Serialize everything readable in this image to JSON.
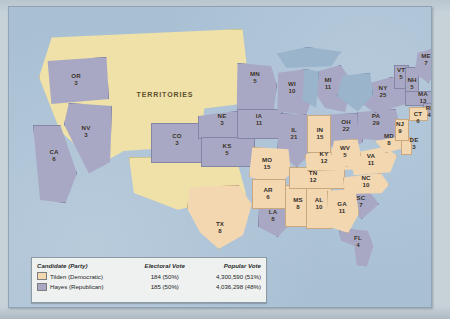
{
  "map": {
    "title": "1876 United States Presidential Election electoral map",
    "territories_label": "TERRITORIES",
    "colors": {
      "democratic": "#f2d7b0",
      "republican": "#a8a8c4",
      "territories": "#efe1a8",
      "water": "#a9c0d4",
      "lake": "#9ab4cc"
    }
  },
  "legend": {
    "headers": {
      "candidate": "Candidate (Party)",
      "electoral": "Electoral Vote",
      "popular": "Popular Vote"
    },
    "rows": [
      {
        "swatch": "democratic",
        "candidate": "Tilden (Democratic)",
        "electoral": "184 (50%)",
        "popular": "4,300,590 (51%)"
      },
      {
        "swatch": "republican",
        "candidate": "Hayes (Republican)",
        "electoral": "185 (50%)",
        "popular": "4,036,298 (48%)"
      }
    ]
  },
  "states": [
    {
      "abbr": "OR",
      "ev": "3",
      "party": "republican"
    },
    {
      "abbr": "NV",
      "ev": "3",
      "party": "republican"
    },
    {
      "abbr": "CA",
      "ev": "6",
      "party": "republican"
    },
    {
      "abbr": "CO",
      "ev": "3",
      "party": "republican"
    },
    {
      "abbr": "NE",
      "ev": "3",
      "party": "republican"
    },
    {
      "abbr": "KS",
      "ev": "5",
      "party": "republican"
    },
    {
      "abbr": "MN",
      "ev": "5",
      "party": "republican"
    },
    {
      "abbr": "IA",
      "ev": "11",
      "party": "republican"
    },
    {
      "abbr": "WI",
      "ev": "10",
      "party": "republican"
    },
    {
      "abbr": "IL",
      "ev": "21",
      "party": "republican"
    },
    {
      "abbr": "MI",
      "ev": "11",
      "party": "republican"
    },
    {
      "abbr": "OH",
      "ev": "22",
      "party": "republican"
    },
    {
      "abbr": "PA",
      "ev": "29",
      "party": "republican"
    },
    {
      "abbr": "NY",
      "ev": "25",
      "party": "republican"
    },
    {
      "abbr": "VT",
      "ev": "5",
      "party": "republican"
    },
    {
      "abbr": "NH",
      "ev": "5",
      "party": "republican"
    },
    {
      "abbr": "ME",
      "ev": "7",
      "party": "republican"
    },
    {
      "abbr": "MA",
      "ev": "13",
      "party": "republican"
    },
    {
      "abbr": "RI",
      "ev": "4",
      "party": "republican"
    },
    {
      "abbr": "LA",
      "ev": "8",
      "party": "republican"
    },
    {
      "abbr": "SC",
      "ev": "7",
      "party": "republican"
    },
    {
      "abbr": "FL",
      "ev": "4",
      "party": "republican"
    },
    {
      "abbr": "TX",
      "ev": "8",
      "party": "democratic"
    },
    {
      "abbr": "AR",
      "ev": "6",
      "party": "democratic"
    },
    {
      "abbr": "MO",
      "ev": "15",
      "party": "democratic"
    },
    {
      "abbr": "IN",
      "ev": "15",
      "party": "democratic"
    },
    {
      "abbr": "TN",
      "ev": "12",
      "party": "democratic"
    },
    {
      "abbr": "MS",
      "ev": "8",
      "party": "democratic"
    },
    {
      "abbr": "AL",
      "ev": "10",
      "party": "democratic"
    },
    {
      "abbr": "GA",
      "ev": "11",
      "party": "democratic"
    },
    {
      "abbr": "NC",
      "ev": "10",
      "party": "democratic"
    },
    {
      "abbr": "VA",
      "ev": "11",
      "party": "democratic"
    },
    {
      "abbr": "WV",
      "ev": "5",
      "party": "democratic"
    },
    {
      "abbr": "MD",
      "ev": "8",
      "party": "democratic"
    },
    {
      "abbr": "KY",
      "ev": "12",
      "party": "democratic"
    },
    {
      "abbr": "CT",
      "ev": "6",
      "party": "democratic"
    },
    {
      "abbr": "NJ",
      "ev": "9",
      "party": "democratic"
    },
    {
      "abbr": "DE",
      "ev": "3",
      "party": "democratic"
    }
  ]
}
